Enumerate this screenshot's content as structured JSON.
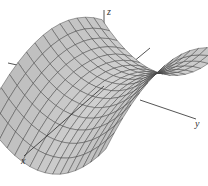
{
  "figure": {
    "title": "",
    "surface": "saddle (hyperbolic paraboloid)",
    "equation_shape": "z = y^2 - x^2",
    "grid_lines_u": 14,
    "grid_lines_v": 16,
    "colors": {
      "background": "#ffffff",
      "surface_light": "#e6e6e6",
      "surface_dark": "#a8a8a8",
      "mesh": "#3a3a3a",
      "axis": "#2a2a2a"
    }
  },
  "axes": {
    "x": {
      "label": "x"
    },
    "y": {
      "label": "y"
    },
    "z": {
      "label": "z"
    }
  },
  "chart_data": {
    "type": "surface",
    "title": "",
    "function": "z = y^2 - x^2",
    "xlabel": "x",
    "ylabel": "y",
    "zlabel": "z",
    "grid": false,
    "mesh": true
  }
}
